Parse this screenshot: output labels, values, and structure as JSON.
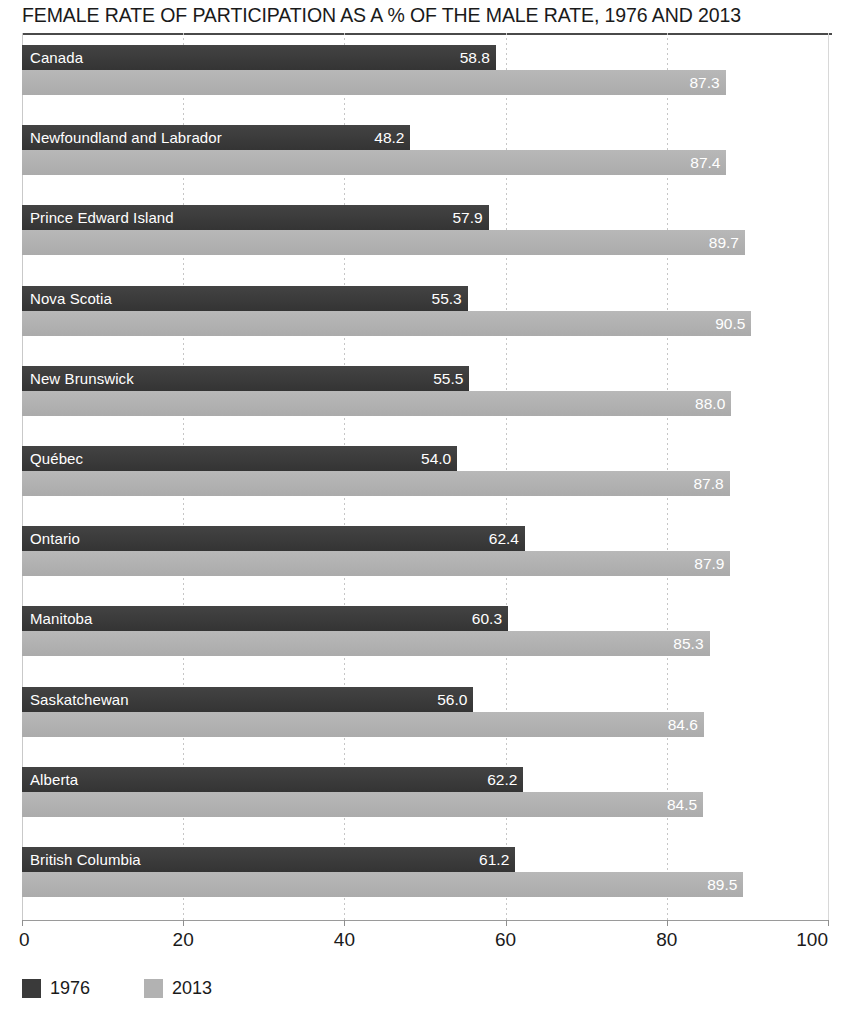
{
  "chart_data": {
    "type": "bar",
    "orientation": "horizontal",
    "title": "FEMALE RATE OF PARTICIPATION AS A % OF THE MALE RATE, 1976 AND 2013",
    "xlabel": "",
    "ylabel": "",
    "xlim": [
      0,
      100
    ],
    "grid": true,
    "grid_axis": "x",
    "legend_position": "bottom-left",
    "xticks": [
      "0",
      "20",
      "40",
      "60",
      "80",
      "100"
    ],
    "xtick_values": [
      0,
      20,
      40,
      60,
      80,
      100
    ],
    "categories": [
      "Canada",
      "Newfoundland and Labrador",
      "Prince Edward Island",
      "Nova Scotia",
      "New Brunswick",
      "Québec",
      "Ontario",
      "Manitoba",
      "Saskatchewan",
      "Alberta",
      "British Columbia"
    ],
    "series": [
      {
        "name": "1976",
        "color": "#3a3a3a",
        "values": [
          58.8,
          48.2,
          57.9,
          55.3,
          55.5,
          54.0,
          62.4,
          60.3,
          56.0,
          62.2,
          61.2
        ],
        "labels": [
          "58.8",
          "48.2",
          "57.9",
          "55.3",
          "55.5",
          "54.0",
          "62.4",
          "60.3",
          "56.0",
          "62.2",
          "61.2"
        ]
      },
      {
        "name": "2013",
        "color": "#b2b2b2",
        "values": [
          87.3,
          87.4,
          89.7,
          90.5,
          88.0,
          87.8,
          87.9,
          85.3,
          84.6,
          84.5,
          89.5
        ],
        "labels": [
          "87.3",
          "87.4",
          "89.7",
          "90.5",
          "88.0",
          "87.8",
          "87.9",
          "85.3",
          "84.6",
          "84.5",
          "89.5"
        ]
      }
    ]
  },
  "legend": {
    "items": [
      {
        "label": "1976",
        "color": "#3a3a3a"
      },
      {
        "label": "2013",
        "color": "#b2b2b2"
      }
    ]
  }
}
